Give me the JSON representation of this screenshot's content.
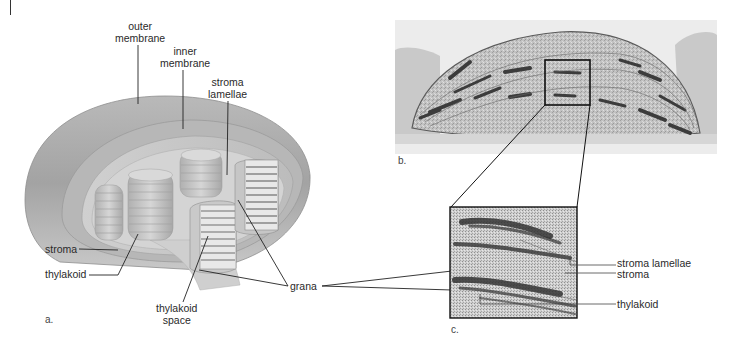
{
  "figure": {
    "panels": [
      {
        "id": "a",
        "letter": "a.",
        "kind": "3D cutaway illustration of a chloroplast"
      },
      {
        "id": "b",
        "letter": "b.",
        "kind": "Electron micrograph of a chloroplast"
      },
      {
        "id": "c",
        "letter": "c.",
        "kind": "Magnified electron micrograph detail of grana"
      }
    ],
    "labels_a": {
      "outer_membrane": [
        "outer",
        "membrane"
      ],
      "inner_membrane": [
        "inner",
        "membrane"
      ],
      "stroma_lamellae": [
        "stroma",
        "lamellae"
      ],
      "stroma": "stroma",
      "thylakoid": "thylakoid",
      "thylakoid_space": [
        "thylakoid",
        "space"
      ],
      "grana": "grana"
    },
    "labels_c": {
      "stroma_lamellae": "stroma lamellae",
      "stroma": "stroma",
      "thylakoid": "thylakoid"
    },
    "colors": {
      "background": "#ffffff",
      "outer_shell": "#a9a9a9",
      "inner_shell": "#c4c4c4",
      "stroma_fill": "#d8d8d8",
      "micrograph_bg": "#bdbdbd",
      "micrograph_dark": "#3c3c3c",
      "leader_line": "#222222"
    }
  }
}
